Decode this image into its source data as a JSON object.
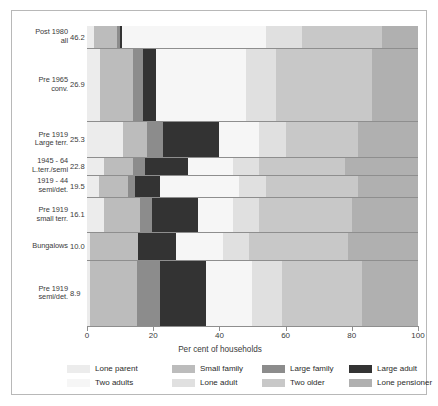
{
  "figure": {
    "xaxis_title": "Per cent of households"
  },
  "chart_data": {
    "type": "bar",
    "subtype": "horizontal-stacked-100",
    "title": "",
    "xlabel": "Per cent of households",
    "ylabel": "",
    "xlim": [
      0,
      100
    ],
    "xticks": [
      0,
      20,
      40,
      60,
      80,
      100
    ],
    "xticklabels": [
      "0",
      "20",
      "40",
      "60",
      "80",
      "100"
    ],
    "grid": false,
    "legend_position": "bottom",
    "value_unit": "per cent",
    "categories": [
      {
        "label": "Post 1980\nall",
        "value": "46.2"
      },
      {
        "label": "Pre 1965\nconv.",
        "value": "26.9"
      },
      {
        "label": "Pre 1919\nLarge terr.",
        "value": "25.3"
      },
      {
        "label": "1945 - 64\nL.terr./semi",
        "value": "22.8"
      },
      {
        "label": "1919 - 44\nsemi/det.",
        "value": "19.5"
      },
      {
        "label": "Pre 1919\nsmall terr.",
        "value": "16.1"
      },
      {
        "label": "Bungalows",
        "value": "10.0"
      },
      {
        "label": "Pre 1919\nsemi/det.",
        "value": "8.9"
      }
    ],
    "series": [
      {
        "name": "Lone parent",
        "color": "#ececec",
        "values": [
          2.0,
          4.0,
          11.0,
          5.0,
          3.5,
          5.0,
          1.0,
          1.0
        ]
      },
      {
        "name": "Small family",
        "color": "#bcbcbc",
        "values": [
          7.0,
          10.0,
          7.0,
          9.0,
          9.0,
          11.0,
          14.5,
          14.0
        ]
      },
      {
        "name": "Large family",
        "color": "#8c8c8c",
        "values": [
          1.0,
          3.0,
          5.0,
          3.5,
          2.0,
          3.5,
          0.0,
          7.0
        ]
      },
      {
        "name": "Large adult",
        "color": "#333333",
        "values": [
          0.5,
          4.0,
          17.0,
          13.0,
          7.5,
          14.0,
          11.5,
          14.0
        ]
      },
      {
        "name": "Two adults",
        "color": "#f6f6f6",
        "values": [
          43.5,
          27.0,
          12.0,
          13.5,
          24.0,
          10.5,
          14.0,
          14.0
        ]
      },
      {
        "name": "Lone adult",
        "color": "#e0e0e0",
        "values": [
          11.0,
          9.0,
          8.0,
          8.0,
          8.0,
          8.0,
          8.0,
          9.0
        ]
      },
      {
        "name": "Two older",
        "color": "#c8c8c8",
        "values": [
          24.0,
          29.0,
          22.0,
          26.0,
          28.0,
          28.0,
          30.0,
          24.0
        ]
      },
      {
        "name": "Lone pensioner",
        "color": "#b0b0b0",
        "values": [
          11.0,
          14.0,
          18.0,
          22.0,
          18.0,
          20.0,
          21.0,
          17.0
        ]
      }
    ]
  },
  "legend": {
    "items": [
      {
        "label": "Lone parent",
        "color": "#ececec"
      },
      {
        "label": "Small family",
        "color": "#bcbcbc"
      },
      {
        "label": "Large family",
        "color": "#8c8c8c"
      },
      {
        "label": "Large adult",
        "color": "#333333"
      },
      {
        "label": "Two adults",
        "color": "#f6f6f6"
      },
      {
        "label": "Lone adult",
        "color": "#e0e0e0"
      },
      {
        "label": "Two older",
        "color": "#c8c8c8"
      },
      {
        "label": "Lone pensioner",
        "color": "#b0b0b0"
      }
    ]
  }
}
